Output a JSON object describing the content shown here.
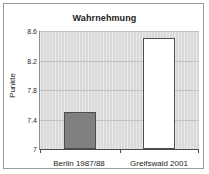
{
  "chart_data": {
    "type": "bar",
    "title": "Wahrnehmung",
    "xlabel": "",
    "ylabel": "Punkte",
    "categories": [
      "Berlin 1987/88",
      "Greifswald 2001"
    ],
    "values": [
      7.5,
      8.5
    ],
    "ylim": [
      7,
      8.6
    ],
    "yticks": [
      "7",
      "7.4",
      "7.8",
      "8.2",
      "8.6"
    ],
    "ytick_values": [
      7,
      7.4,
      7.8,
      8.2,
      8.6
    ],
    "grid": true,
    "legend": "none",
    "series": [
      {
        "name": "Punkte",
        "values": [
          7.5,
          8.5
        ],
        "bar_colors": [
          "#808080",
          "#ffffff"
        ],
        "bar_border": "#4d4d4d"
      }
    ],
    "colors": {
      "plot_background": "#d9d9d9",
      "frame_border": "#9a9a9a",
      "gridline": "#c2c2c2",
      "axis": "#4a4a4a",
      "text": "#1b1b1b"
    }
  }
}
